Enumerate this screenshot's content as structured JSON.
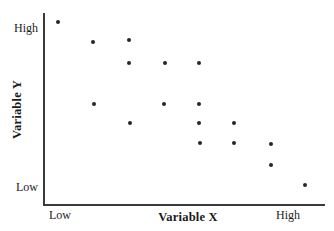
{
  "chart_data": {
    "type": "scatter",
    "title": "",
    "xlabel": "Variable X",
    "ylabel": "Variable Y",
    "x_tick_labels": [
      "Low",
      "High"
    ],
    "y_tick_labels": [
      "Low",
      "High"
    ],
    "xlim": [
      0,
      100
    ],
    "ylim": [
      0,
      100
    ],
    "grid": false,
    "legend": null,
    "marker": "filled-circle",
    "marker_color": "#262626",
    "axis_color": "#3a3a3a",
    "background_color": "#ffffff",
    "n_points": 17,
    "points": [
      {
        "x": 5.3,
        "y": 95.3
      },
      {
        "x": 17.7,
        "y": 84.9
      },
      {
        "x": 30.5,
        "y": 85.9
      },
      {
        "x": 30.5,
        "y": 73.9
      },
      {
        "x": 43.3,
        "y": 73.9
      },
      {
        "x": 55.3,
        "y": 73.9
      },
      {
        "x": 18.1,
        "y": 52.6
      },
      {
        "x": 42.9,
        "y": 52.6
      },
      {
        "x": 55.3,
        "y": 52.6
      },
      {
        "x": 30.9,
        "y": 42.7
      },
      {
        "x": 55.3,
        "y": 42.7
      },
      {
        "x": 67.7,
        "y": 42.7
      },
      {
        "x": 55.7,
        "y": 32.3
      },
      {
        "x": 67.7,
        "y": 32.3
      },
      {
        "x": 80.9,
        "y": 31.8
      },
      {
        "x": 80.5,
        "y": 21.0
      },
      {
        "x": 92.6,
        "y": 10.5
      }
    ],
    "pixel_points": [
      {
        "px": 58,
        "py": 22
      },
      {
        "px": 93,
        "py": 42
      },
      {
        "px": 129,
        "py": 40
      },
      {
        "px": 129,
        "py": 63
      },
      {
        "px": 165,
        "py": 63
      },
      {
        "px": 199,
        "py": 63
      },
      {
        "px": 94,
        "py": 104
      },
      {
        "px": 164,
        "py": 104
      },
      {
        "px": 199,
        "py": 104
      },
      {
        "px": 130,
        "py": 123
      },
      {
        "px": 199,
        "py": 123
      },
      {
        "px": 234,
        "py": 123
      },
      {
        "px": 200,
        "py": 143
      },
      {
        "px": 234,
        "py": 143
      },
      {
        "px": 271,
        "py": 144
      },
      {
        "px": 271,
        "py": 165
      },
      {
        "px": 305,
        "py": 185
      }
    ]
  },
  "axes": {
    "y_title": "Variable Y",
    "x_title": "Variable X",
    "y_high_label": "High",
    "y_low_label": "Low",
    "x_low_label": "Low",
    "x_high_label": "High"
  }
}
